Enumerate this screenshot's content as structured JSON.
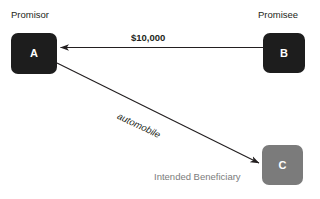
{
  "diagram": {
    "title_text": "Third-party beneficiary contract diagram",
    "background_color": "#ffffff",
    "nodes": [
      {
        "id": "A",
        "letter": "A",
        "role_label": "Promisor",
        "fill_color": "#1d1d1d",
        "text_color": "#ffffff"
      },
      {
        "id": "B",
        "letter": "B",
        "role_label": "Promisee",
        "fill_color": "#1d1d1d",
        "text_color": "#ffffff"
      },
      {
        "id": "C",
        "letter": "C",
        "role_label": "Intended Beneficiary",
        "fill_color": "#7b7b7b",
        "text_color": "#ffffff"
      }
    ],
    "edges": [
      {
        "id": "payment",
        "from": "B",
        "to": "A",
        "label": "$10,000",
        "style": "bold",
        "color": "#231f20"
      },
      {
        "id": "consideration",
        "from": "A",
        "to": "C",
        "label": "automobile",
        "style": "italic",
        "color": "#231f20"
      }
    ]
  }
}
